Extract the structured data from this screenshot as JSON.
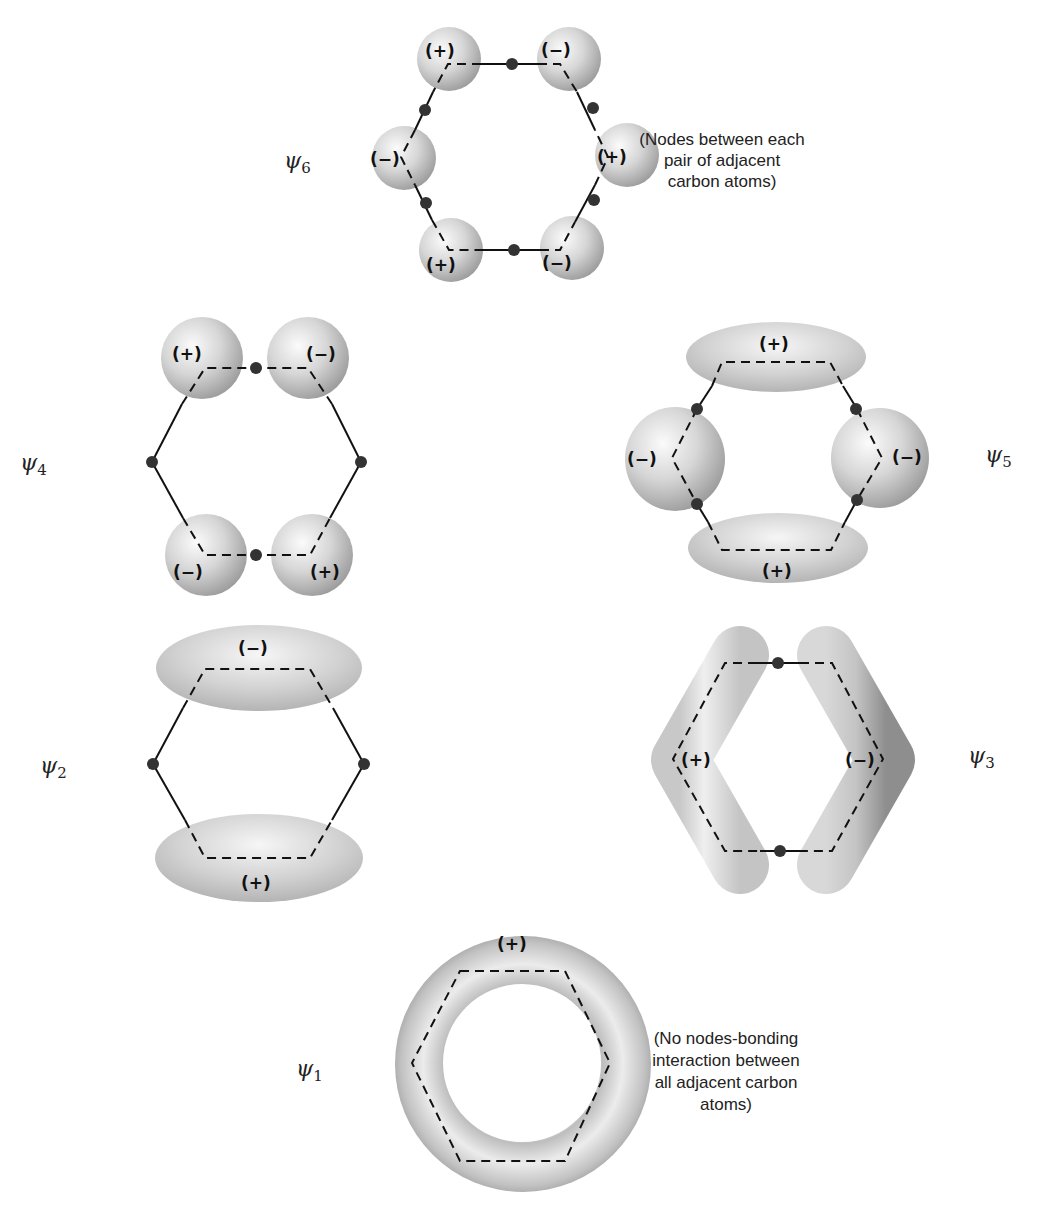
{
  "colors": {
    "orbital_light": "#f4f4f4",
    "orbital_dark": "#9a9a9a",
    "line": "#111111",
    "node": "#333333"
  },
  "orbitals": [
    {
      "id": "psi6",
      "label": "ψ",
      "subscript": "6",
      "lobes": [
        {
          "position": "top-left",
          "sign": "(+)"
        },
        {
          "position": "top-right",
          "sign": "(−)"
        },
        {
          "position": "left",
          "sign": "(−)"
        },
        {
          "position": "right",
          "sign": "(+)"
        },
        {
          "position": "bottom-left",
          "sign": "(+)"
        },
        {
          "position": "bottom-right",
          "sign": "(−)"
        }
      ],
      "node_count": 6,
      "note": [
        "(Nodes between each",
        "pair of adjacent",
        "carbon atoms)"
      ]
    },
    {
      "id": "psi4",
      "label": "ψ",
      "subscript": "4",
      "lobes": [
        {
          "position": "top-left",
          "sign": "(+)"
        },
        {
          "position": "top-right",
          "sign": "(−)"
        },
        {
          "position": "bottom-left",
          "sign": "(−)"
        },
        {
          "position": "bottom-right",
          "sign": "(+)"
        }
      ],
      "node_count": 4
    },
    {
      "id": "psi5",
      "label": "ψ",
      "subscript": "5",
      "lobes": [
        {
          "position": "top",
          "sign": "(+)"
        },
        {
          "position": "left",
          "sign": "(−)"
        },
        {
          "position": "right",
          "sign": "(−)"
        },
        {
          "position": "bottom",
          "sign": "(+)"
        }
      ],
      "node_count": 4
    },
    {
      "id": "psi2",
      "label": "ψ",
      "subscript": "2",
      "lobes": [
        {
          "position": "top",
          "sign": "(−)"
        },
        {
          "position": "bottom",
          "sign": "(+)"
        }
      ],
      "node_count": 2
    },
    {
      "id": "psi3",
      "label": "ψ",
      "subscript": "3",
      "lobes": [
        {
          "position": "left",
          "sign": "(+)"
        },
        {
          "position": "right",
          "sign": "(−)"
        }
      ],
      "node_count": 2
    },
    {
      "id": "psi1",
      "label": "ψ",
      "subscript": "1",
      "lobes": [
        {
          "position": "top",
          "sign": "(+)"
        }
      ],
      "node_count": 0,
      "note": [
        "(No nodes-bonding",
        "interaction between",
        "all adjacent carbon",
        "atoms)"
      ]
    }
  ]
}
